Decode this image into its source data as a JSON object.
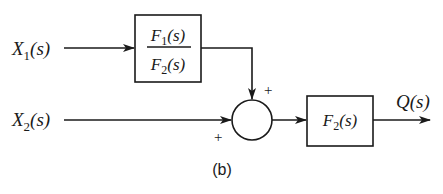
{
  "diagram": {
    "type": "block-diagram",
    "caption": "(b)",
    "inputs": [
      {
        "id": "x1",
        "label": "X",
        "sub": "1",
        "suffix": "(s)"
      },
      {
        "id": "x2",
        "label": "X",
        "sub": "2",
        "suffix": "(s)"
      }
    ],
    "blocks": [
      {
        "id": "block1",
        "numerator": {
          "label": "F",
          "sub": "1",
          "suffix": "(s)"
        },
        "denominator": {
          "label": "F",
          "sub": "2",
          "suffix": "(s)"
        }
      },
      {
        "id": "block2",
        "label": "F",
        "sub": "2",
        "suffix": "(s)"
      }
    ],
    "summing_junction": {
      "id": "sum",
      "signs": [
        "+",
        "+"
      ]
    },
    "output": {
      "id": "q",
      "label": "Q",
      "suffix": "(s)"
    },
    "connections": [
      {
        "from": "x1",
        "to": "block1"
      },
      {
        "from": "block1",
        "to": "sum",
        "sign": "+"
      },
      {
        "from": "x2",
        "to": "sum",
        "sign": "+"
      },
      {
        "from": "sum",
        "to": "block2"
      },
      {
        "from": "block2",
        "to": "q"
      }
    ],
    "colors": {
      "stroke": "#1a1a1a",
      "background": "#ffffff"
    }
  }
}
